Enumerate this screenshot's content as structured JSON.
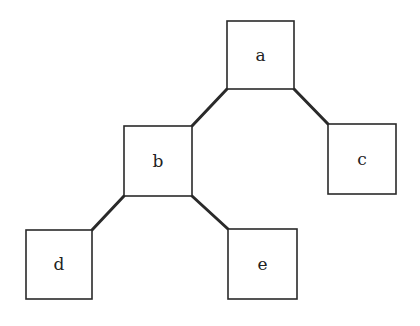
{
  "diagram": {
    "type": "binary-tree",
    "nodes": [
      {
        "id": "a",
        "label": "a",
        "x": 227,
        "y": 21,
        "w": 67,
        "h": 68
      },
      {
        "id": "b",
        "label": "b",
        "x": 124,
        "y": 126,
        "w": 68,
        "h": 70
      },
      {
        "id": "c",
        "label": "c",
        "x": 328,
        "y": 124,
        "w": 68,
        "h": 70
      },
      {
        "id": "d",
        "label": "d",
        "x": 26,
        "y": 230,
        "w": 66,
        "h": 69
      },
      {
        "id": "e",
        "label": "e",
        "x": 228,
        "y": 229,
        "w": 69,
        "h": 70
      }
    ],
    "edges": [
      {
        "from": "a",
        "to": "b"
      },
      {
        "from": "a",
        "to": "c"
      },
      {
        "from": "b",
        "to": "d"
      },
      {
        "from": "b",
        "to": "e"
      }
    ],
    "colors": {
      "stroke": "#2a2a2a",
      "fill": "#ffffff",
      "text": "#222222"
    }
  }
}
